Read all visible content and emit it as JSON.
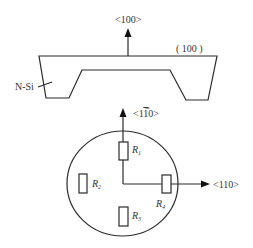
{
  "diagram": {
    "type": "piezoresistive pressure sensor structure",
    "cross_section": {
      "direction_label": "<100>",
      "plane_label": "( 100 )",
      "material_label": "N-Si"
    },
    "top_view": {
      "vertical_axis_label_prefix": "<1",
      "vertical_axis_label_bar": "1",
      "vertical_axis_label_suffix": "0>",
      "horizontal_axis_label": "<110>",
      "resistors": [
        {
          "name": "R",
          "subscript": "1"
        },
        {
          "name": "R",
          "subscript": "2"
        },
        {
          "name": "R",
          "subscript": "3"
        },
        {
          "name": "R",
          "subscript": "4"
        }
      ]
    },
    "colors": {
      "line": "#2a2a2a",
      "text": "#333333",
      "background": "#ffffff"
    }
  }
}
